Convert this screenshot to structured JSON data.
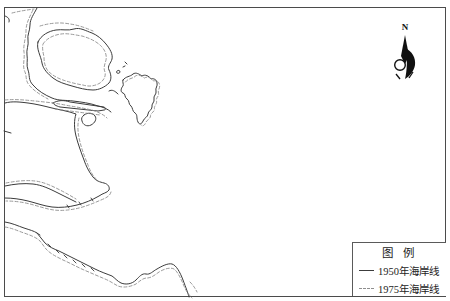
{
  "north": {
    "label": "N"
  },
  "legend": {
    "title": "图 例",
    "items": [
      {
        "label": "1950年海岸线",
        "line_style": "solid"
      },
      {
        "label": "1975年海岸线",
        "line_style": "dashed"
      }
    ]
  },
  "colors": {
    "coastline_1950": "#3c3c3c",
    "coastline_1975": "#8e8e8e",
    "map_border": "#4b4b4b",
    "background": "#ffffff",
    "north_arrow": "#111111"
  }
}
